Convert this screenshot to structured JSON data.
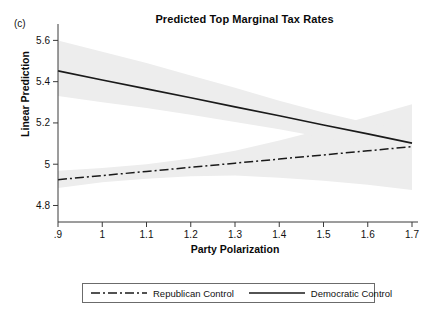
{
  "panel": {
    "label": "(c)"
  },
  "chart_data": {
    "type": "line",
    "title": "Predicted Top Marginal Tax Rates",
    "xlabel": "Party Polarization",
    "ylabel": "Linear Prediction",
    "xlim": [
      0.9,
      1.7
    ],
    "ylim": [
      4.72,
      5.66
    ],
    "xticks": [
      ".9",
      "1",
      "1.1",
      "1.2",
      "1.3",
      "1.4",
      "1.5",
      "1.6",
      "1.7"
    ],
    "xtick_values": [
      0.9,
      1.0,
      1.1,
      1.2,
      1.3,
      1.4,
      1.5,
      1.6,
      1.7
    ],
    "yticks": [
      "4.8",
      "5",
      "5.2",
      "5.4",
      "5.6"
    ],
    "ytick_values": [
      4.8,
      5.0,
      5.2,
      5.4,
      5.6
    ],
    "grid": false,
    "legend_position": "bottom-outside",
    "x": [
      0.9,
      1.0,
      1.1,
      1.2,
      1.3,
      1.4,
      1.5,
      1.6,
      1.7
    ],
    "series": [
      {
        "name": "Republican Control",
        "style": "dash-dot",
        "color": "#1a1a1a",
        "values": [
          4.925,
          4.945,
          4.965,
          4.985,
          5.005,
          5.025,
          5.045,
          5.065,
          5.085
        ],
        "ci_lower": [
          4.885,
          4.912,
          4.93,
          4.942,
          4.945,
          4.935,
          4.92,
          4.9,
          4.875
        ],
        "ci_upper": [
          4.968,
          4.982,
          5.0,
          5.028,
          5.065,
          5.115,
          5.17,
          5.23,
          5.29
        ]
      },
      {
        "name": "Democratic Control",
        "style": "solid",
        "color": "#1a1a1a",
        "values": [
          5.452,
          5.408,
          5.365,
          5.322,
          5.278,
          5.235,
          5.19,
          5.147,
          5.102
        ],
        "ci_lower": [
          5.33,
          5.3,
          5.272,
          5.24,
          5.205,
          5.17,
          5.13,
          5.088,
          5.04
        ],
        "ci_upper": [
          5.6,
          5.545,
          5.49,
          5.43,
          5.37,
          5.308,
          5.25,
          5.2,
          5.16
        ]
      }
    ],
    "ci_fill_color": "#ededed"
  },
  "legend": {
    "items": [
      {
        "label": "Republican Control",
        "style": "dash-dot"
      },
      {
        "label": "Democratic Control",
        "style": "solid"
      }
    ]
  }
}
